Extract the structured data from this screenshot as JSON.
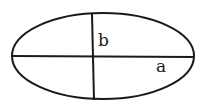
{
  "diagram": {
    "shape": "ellipse",
    "stroke_color": "#1a1a1a",
    "background": "#ffffff",
    "labels": {
      "semi_minor_axis": "b",
      "semi_major_axis": "a"
    }
  }
}
